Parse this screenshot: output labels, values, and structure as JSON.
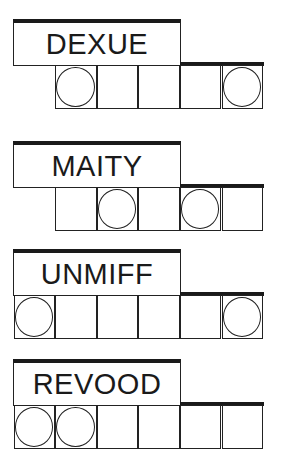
{
  "colors": {
    "ink": "#1a1a1a",
    "background": "#ffffff"
  },
  "puzzles": [
    {
      "word": "DEXUE",
      "top": 19,
      "cell_start": 1,
      "cell_count": 5,
      "circled": [
        1,
        5
      ]
    },
    {
      "word": "MAITY",
      "top": 141,
      "cell_start": 1,
      "cell_count": 5,
      "circled": [
        2,
        4
      ]
    },
    {
      "word": "UNMIFF",
      "top": 249,
      "cell_start": 0,
      "cell_count": 6,
      "circled": [
        0,
        5
      ]
    },
    {
      "word": "REVOOD",
      "top": 359,
      "cell_start": 0,
      "cell_count": 6,
      "circled": [
        0,
        1
      ]
    }
  ]
}
